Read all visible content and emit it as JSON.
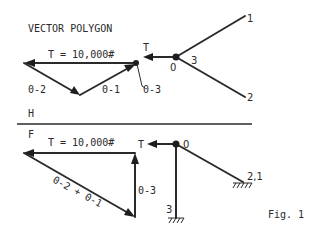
{
  "title": "VECTOR POLYGON",
  "figure_caption": "Fig. 1",
  "colors": {
    "ink": "#2a2a2a",
    "background": "#ffffff"
  },
  "top_section": {
    "polygon": {
      "tension_label": "T = 10,000#",
      "member_labels": {
        "a": "0-2",
        "b": "0-1",
        "c": "0-3"
      }
    },
    "structure": {
      "tension_label": "T",
      "node_label": "0",
      "member_label": "3",
      "end_labels": {
        "upper": "1",
        "lower": "2"
      }
    }
  },
  "divider": {
    "upper_label": "H",
    "lower_label": "F"
  },
  "bottom_section": {
    "polygon": {
      "tension_label": "T = 10,000#",
      "diagonal_label": "0-2 + 0-1",
      "vertical_label": "0-3"
    },
    "structure": {
      "tension_label": "T",
      "node_label": "0",
      "support_labels": {
        "vertical": "3",
        "diagonal": "2,1"
      }
    }
  }
}
